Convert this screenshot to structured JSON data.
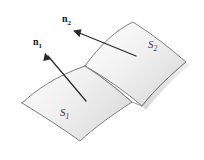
{
  "figure": {
    "background_color": "#ffffff",
    "outline_color": "#6f6f6f",
    "vector_color": "#2b2b2b",
    "label_color": "#3a3a3a",
    "fill_light": "#ffffff",
    "fill_dark": "#e3e3e3",
    "surfaces": [
      {
        "id": "s1",
        "label": "S",
        "subscript": "1",
        "label_x": 60,
        "label_y": 116,
        "description": "front-left curved surface patch"
      },
      {
        "id": "s2",
        "label": "S",
        "subscript": "2",
        "label_x": 148,
        "label_y": 48,
        "description": "back-right curved surface patch"
      }
    ],
    "vectors": [
      {
        "id": "n1",
        "label": "n",
        "subscript": "1",
        "label_x": 33,
        "label_y": 45,
        "tail_x": 86,
        "tail_y": 101,
        "tip_x": 45,
        "tip_y": 53,
        "description": "unit normal vector to surface S1"
      },
      {
        "id": "n2",
        "label": "n",
        "subscript": "2",
        "label_x": 62,
        "label_y": 22,
        "tail_x": 136,
        "tail_y": 56,
        "tip_x": 73,
        "tip_y": 31,
        "description": "unit normal vector to surface S2"
      }
    ],
    "geometry": {
      "s1_path": "M 22 103 C 36 90 56 76 85 66 C 104 78 118 90 132 102 C 112 115 94 128 80 141 C 62 128 40 114 22 103 Z",
      "s2_path": "M 85 66 C 100 45 116 30 133 22 C 152 34 170 48 186 62 C 172 74 156 88 142 106 C 126 92 106 78 85 66 Z",
      "crease_path": "M 85 66 C 104 78 118 90 132 102 L 142 106"
    }
  }
}
